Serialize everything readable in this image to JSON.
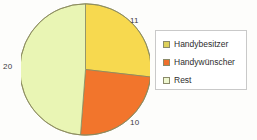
{
  "chart_data": {
    "type": "pie",
    "title": "",
    "subtitle": "",
    "xlabel": "",
    "ylabel": "",
    "grid": false,
    "legend_position": "right",
    "start_angle_deg": 0,
    "direction": "clockwise",
    "total": 41,
    "categories": [
      "Handybesitzer",
      "Handywünscher",
      "Rest"
    ],
    "values": [
      11,
      10,
      20
    ],
    "colors": [
      "#f7d94f",
      "#f2752c",
      "#e9f5b4"
    ],
    "data_labels": [
      "11",
      "10",
      "20"
    ],
    "slices": [
      {
        "label": "Handybesitzer",
        "value": 11,
        "color": "#f7d94f",
        "data_label": "11",
        "label_position": "top-right"
      },
      {
        "label": "Handywünscher",
        "value": 10,
        "color": "#f2752c",
        "data_label": "10",
        "label_position": "bottom-right"
      },
      {
        "label": "Rest",
        "value": 20,
        "color": "#e9f5b4",
        "data_label": "20",
        "label_position": "left"
      }
    ]
  },
  "legend": {
    "items": [
      {
        "label": "Handybesitzer",
        "color": "#ddd05a"
      },
      {
        "label": "Handywünscher",
        "color": "#ef6f2c"
      },
      {
        "label": "Rest",
        "color": "#eef7cf"
      }
    ]
  },
  "pie": {
    "outline_color": "#8a8a5e"
  }
}
